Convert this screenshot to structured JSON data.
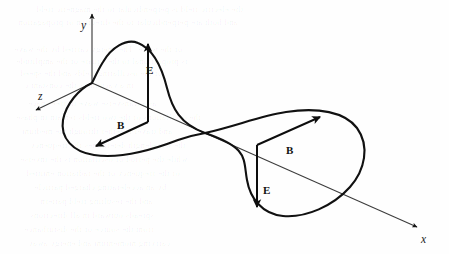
{
  "figure": {
    "background_color": "#fefefe",
    "ink_color": "#111111",
    "axis_color": "#3a3a3a",
    "axes": [
      {
        "name": "y-axis",
        "label": "y",
        "label_x": 81,
        "label_y": 29,
        "from": [
          92,
          83
        ],
        "to": [
          92,
          14
        ],
        "arrow": true
      },
      {
        "name": "z-axis",
        "label": "z",
        "label_x": 38,
        "label_y": 100,
        "from": [
          92,
          83
        ],
        "to": [
          36,
          110
        ],
        "arrow": true
      },
      {
        "name": "x-axis",
        "label": "x",
        "label_x": 421,
        "label_y": 243,
        "from": [
          92,
          83
        ],
        "to": [
          417,
          227
        ],
        "arrow": true
      }
    ],
    "vectors": [
      {
        "name": "E-vector-up",
        "label": "E",
        "label_x": 146,
        "label_y": 74,
        "from": [
          148,
          122
        ],
        "to": [
          148,
          44
        ],
        "kind": "E"
      },
      {
        "name": "B-vector-left",
        "label": "B",
        "label_x": 117,
        "label_y": 129,
        "from": [
          148,
          122
        ],
        "to": [
          96,
          146
        ],
        "kind": "B"
      },
      {
        "name": "B-vector-right",
        "label": "B",
        "label_x": 286,
        "label_y": 154,
        "from": [
          257,
          145
        ],
        "to": [
          320,
          117
        ],
        "kind": "B"
      },
      {
        "name": "E-vector-down",
        "label": "E",
        "label_x": 263,
        "label_y": 194,
        "from": [
          257,
          145
        ],
        "to": [
          257,
          207
        ],
        "kind": "E"
      }
    ],
    "wave_curve": {
      "name": "electromagnetic-wave-loop",
      "description": "Closed sinusoidal loop crossing itself on the x-axis",
      "crossing_point": [
        205,
        133
      ],
      "stroke_width": 2.1,
      "path": "M 92 83 C 79 89 66 104 63 120 C 60 138 73 152 94 155 C 120 159 152 150 178 140 C 192 135 199 134 205 133 C 236 126 260 116 286 112 C 318 107 345 112 357 128 C 370 146 365 170 350 187 C 333 206 306 218 283 216 C 262 214 250 198 247 180 C 243 158 249 148 205 133 C 180 124 172 108 167 88 C 161 64 151 48 138 43 C 126 38 111 48 103 62 C 98 70 95 77 92 83 Z"
    }
  },
  "ghost_text": {
    "note": "faint bleed-through text from reverse of scanned page",
    "lines": [
      {
        "text": "the electric field is perpendicular to the magnetic field",
        "x": 36,
        "y": 4,
        "size": 8.5,
        "opacity": 0.05
      },
      {
        "text": "and both are perpendicular to the direction of propagation",
        "x": 18,
        "y": 17,
        "size": 8.5,
        "opacity": 0.05
      },
      {
        "text": "of the wave. The energy carried by the wave",
        "x": 14,
        "y": 44,
        "size": 8.5,
        "opacity": 0.05
      },
      {
        "text": "is proportional to the square of the amplitude",
        "x": 16,
        "y": 56,
        "size": 8.5,
        "opacity": 0.05
      },
      {
        "text": "of the oscillating fields and the speed",
        "x": 20,
        "y": 68,
        "size": 8.5,
        "opacity": 0.05
      },
      {
        "text": "in a vacuum is the constant c",
        "x": 24,
        "y": 80,
        "size": 8.5,
        "opacity": 0.05
      },
      {
        "text": "as a transverse wave in free space",
        "x": 28,
        "y": 98,
        "size": 8.5,
        "opacity": 0.05
      },
      {
        "text": "the oscillations of the two fields remain in phase",
        "x": 16,
        "y": 112,
        "size": 8.5,
        "opacity": 0.05
      },
      {
        "text": "and travel together through the medium",
        "x": 22,
        "y": 126,
        "size": 8.5,
        "opacity": 0.05
      },
      {
        "text": "the wavelength determines the frequency",
        "x": 30,
        "y": 140,
        "size": 8.5,
        "opacity": 0.05
      },
      {
        "text": "while the period of oscillation is the inverse",
        "x": 20,
        "y": 154,
        "size": 8.5,
        "opacity": 0.05
      },
      {
        "text": "of the frequency of the radiation emitted",
        "x": 26,
        "y": 168,
        "size": 8.5,
        "opacity": 0.05
      },
      {
        "text": "by an accelerating charged particle",
        "x": 34,
        "y": 182,
        "size": 8.5,
        "opacity": 0.05
      },
      {
        "text": "and the resulting field pattern",
        "x": 40,
        "y": 196,
        "size": 8.5,
        "opacity": 0.05
      },
      {
        "text": "spreads outward in all directions",
        "x": 30,
        "y": 210,
        "size": 8.5,
        "opacity": 0.05
      },
      {
        "text": "from the source of the disturbance",
        "x": 24,
        "y": 224,
        "size": 8.5,
        "opacity": 0.05
      },
      {
        "text": "carrying momentum and energy away",
        "x": 28,
        "y": 238,
        "size": 8.5,
        "opacity": 0.05
      }
    ]
  }
}
